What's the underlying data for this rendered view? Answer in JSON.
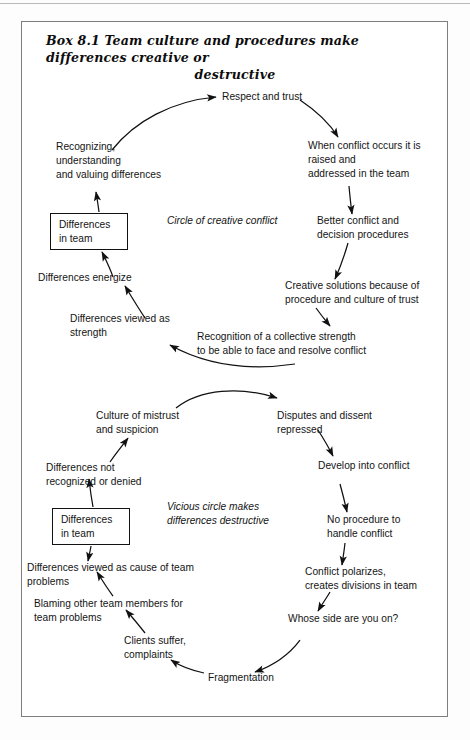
{
  "page": {
    "width": 470,
    "height": 740,
    "background": "#ffffff",
    "frame_color": "#7e7e7e"
  },
  "box": {
    "label": "Box 8.1",
    "title_line1": "Box 8.1  Team culture and procedures make differences creative or",
    "title_line2": "destructive",
    "title_full": "Box 8.1  Team culture and procedures make differences creative or destructive"
  },
  "diagram": {
    "type": "causal-loop-diagram",
    "captions": [
      {
        "id": "caption-creative",
        "text": "Circle of creative conflict"
      },
      {
        "id": "caption-vicious",
        "text": "Vicious circle makes\ndifferences destructive"
      }
    ],
    "boxes": [
      {
        "id": "differences-in-team-top",
        "text": "Differences\nin team"
      },
      {
        "id": "differences-in-team-bottom",
        "text": "Differences\nin team"
      }
    ],
    "creative_cycle": {
      "name": "Circle of creative conflict",
      "nodes": [
        {
          "id": "respect-and-trust",
          "text": "Respect and trust"
        },
        {
          "id": "when-conflict-occurs",
          "text": "When conflict occurs it is\nraised and\naddressed in the team"
        },
        {
          "id": "better-conflict",
          "text": "Better conflict and\ndecision procedures"
        },
        {
          "id": "creative-solutions",
          "text": "Creative solutions because of\nprocedure and culture of trust"
        },
        {
          "id": "recognition-collective-strength",
          "text": "Recognition of a collective strength\nto be able to face and resolve conflict"
        },
        {
          "id": "differences-viewed-strength",
          "text": "Differences viewed as\nstrength"
        },
        {
          "id": "differences-energize",
          "text": "Differences energize"
        },
        {
          "id": "differences-in-team-top",
          "text": "Differences\nin team"
        },
        {
          "id": "recognizing-understanding",
          "text": "Recognizing,\nunderstanding\nand valuing differences"
        }
      ]
    },
    "vicious_cycle": {
      "name": "Vicious circle makes differences destructive",
      "nodes": [
        {
          "id": "culture-of-mistrust",
          "text": "Culture of mistrust\nand suspicion"
        },
        {
          "id": "disputes-dissent-repressed",
          "text": "Disputes and dissent\nrepressed"
        },
        {
          "id": "develop-into-conflict",
          "text": "Develop into conflict"
        },
        {
          "id": "no-procedure",
          "text": "No procedure to\nhandle conflict"
        },
        {
          "id": "conflict-polarizes",
          "text": "Conflict polarizes,\ncreates divisions in team"
        },
        {
          "id": "whose-side",
          "text": "Whose side are you on?"
        },
        {
          "id": "fragmentation",
          "text": "Fragmentation"
        },
        {
          "id": "clients-suffer",
          "text": "Clients suffer,\ncomplaints"
        },
        {
          "id": "blaming-other-members",
          "text": "Blaming other team members for\nteam problems"
        },
        {
          "id": "differences-viewed-cause",
          "text": "Differences viewed as cause of team\nproblems"
        },
        {
          "id": "differences-in-team-bottom",
          "text": "Differences\nin team"
        },
        {
          "id": "differences-not-recognized",
          "text": "Differences not\nrecognized or denied"
        }
      ]
    }
  }
}
